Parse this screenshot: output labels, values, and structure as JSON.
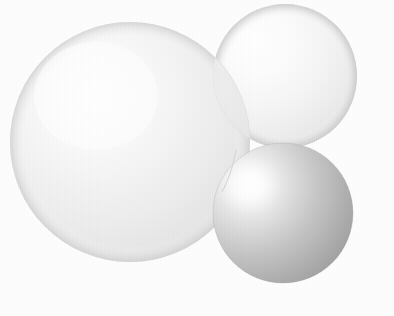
{
  "scene": {
    "title": "Three Spheres Render",
    "width": 394,
    "height": 316,
    "background_color": "#fdfdfd",
    "render_style": "raytraced-spheres",
    "caption": ""
  },
  "chart_data": {
    "type": "scatter",
    "xlabel": "",
    "ylabel": "",
    "xlim": [
      0,
      394
    ],
    "ylim": [
      0,
      316
    ],
    "grid": false,
    "legend_position": "none",
    "categories": [
      "large-sphere",
      "top-right-sphere",
      "bottom-right-sphere"
    ],
    "values": [
      120,
      72,
      70
    ],
    "series": [
      {
        "name": "radius",
        "values": [
          120,
          72,
          70
        ]
      },
      {
        "name": "center_x",
        "values": [
          130,
          285,
          283
        ]
      },
      {
        "name": "center_y",
        "values": [
          142,
          76,
          213
        ]
      }
    ]
  },
  "spheres": [
    {
      "id": "large-sphere",
      "label": "Large white sphere",
      "cx": 130,
      "cy": 142,
      "r": 120,
      "highlight_cx": 96,
      "highlight_cy": 96,
      "highlight_color": "#fefefe",
      "mid_color": "#f3f3f3",
      "edge_color": "#e4e4e4",
      "rim_color": "#dcdcdc",
      "z_order": 1
    },
    {
      "id": "top-right-sphere",
      "label": "Top right white sphere",
      "cx": 285,
      "cy": 76,
      "r": 72,
      "highlight_cx": 258,
      "highlight_cy": 44,
      "highlight_color": "#ffffff",
      "mid_color": "#f6f6f6",
      "edge_color": "#e1e1e1",
      "rim_color": "#d4d4d4",
      "z_order": 2
    },
    {
      "id": "bottom-right-sphere",
      "label": "Bottom right gray sphere",
      "cx": 283,
      "cy": 213,
      "r": 70,
      "highlight_cx": 249,
      "highlight_cy": 184,
      "highlight_color": "#ffffff",
      "mid_color": "#c2c2c2",
      "edge_color": "#9a9a9a",
      "rim_color": "#878787",
      "z_order": 3
    }
  ],
  "colors": {
    "background": "#fdfdfd",
    "sphere_white_highlight": "#ffffff",
    "sphere_white_body": "#f2f2f2",
    "sphere_white_shadow": "#dcdcdc",
    "sphere_gray_highlight": "#ffffff",
    "sphere_gray_body": "#bdbdbd",
    "sphere_gray_shadow": "#878787",
    "intersection_seam": "#d8d8d8"
  }
}
